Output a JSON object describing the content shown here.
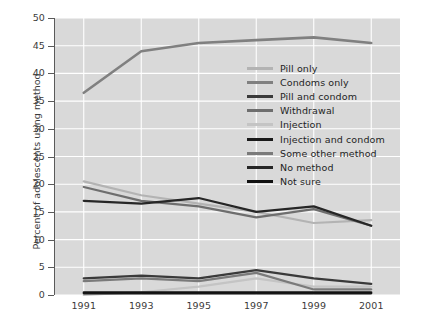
{
  "chart_data": {
    "type": "line",
    "title": "",
    "xlabel": "",
    "ylabel": "Percent of adolescents using method",
    "categories": [
      "1991",
      "1993",
      "1995",
      "1997",
      "1999",
      "2001"
    ],
    "x": [
      1991,
      1993,
      1995,
      1997,
      1999,
      2001
    ],
    "ylim": [
      0,
      50
    ],
    "yticks": [
      0,
      5,
      10,
      15,
      20,
      25,
      30,
      35,
      40,
      45,
      50
    ],
    "grid": true,
    "legend_position": "center-right",
    "plot_background": "#d9d9d9",
    "series": [
      {
        "name": "Pill only",
        "color": "#b3b3b3",
        "width": 2.2,
        "values": [
          20.5,
          18.0,
          16.5,
          15.0,
          13.0,
          13.5
        ]
      },
      {
        "name": "Condoms only",
        "color": "#808080",
        "width": 2.6,
        "values": [
          36.5,
          44.0,
          45.5,
          46.0,
          46.5,
          45.5
        ]
      },
      {
        "name": "Pill and condom",
        "color": "#3a3a3a",
        "width": 2.2,
        "values": [
          3.0,
          3.5,
          3.0,
          4.5,
          3.0,
          2.0
        ]
      },
      {
        "name": "Withdrawal",
        "color": "#6e6e6e",
        "width": 2.2,
        "values": [
          19.5,
          17.0,
          16.0,
          14.0,
          15.5,
          12.5
        ]
      },
      {
        "name": "Injection",
        "color": "#c4c4c4",
        "width": 2.2,
        "values": [
          0.0,
          0.5,
          1.5,
          3.0,
          1.5,
          1.5
        ]
      },
      {
        "name": "Injection and condom",
        "color": "#1a1a1a",
        "width": 2.2,
        "values": [
          0.3,
          0.3,
          0.3,
          0.3,
          0.3,
          0.3
        ]
      },
      {
        "name": "Some other method",
        "color": "#7a7a7a",
        "width": 2.2,
        "values": [
          2.5,
          3.0,
          2.5,
          4.0,
          1.0,
          1.0
        ]
      },
      {
        "name": "No method",
        "color": "#262626",
        "width": 2.2,
        "values": [
          17.0,
          16.5,
          17.5,
          15.0,
          16.0,
          12.5
        ]
      },
      {
        "name": "Not sure",
        "color": "#111111",
        "width": 2.2,
        "values": [
          0.5,
          0.5,
          0.5,
          0.5,
          0.5,
          0.5
        ]
      }
    ]
  },
  "axis": {
    "y_title": "Percent of adolescents using method",
    "y_tick_labels": [
      "0",
      "5",
      "10",
      "15",
      "20",
      "25",
      "30",
      "35",
      "40",
      "45",
      "50"
    ],
    "x_tick_labels": [
      "1991",
      "1993",
      "1995",
      "1997",
      "1999",
      "2001"
    ]
  },
  "legend": {
    "items": [
      {
        "label": "Pill only",
        "color": "#b3b3b3"
      },
      {
        "label": "Condoms only",
        "color": "#808080"
      },
      {
        "label": "Pill and condom",
        "color": "#3a3a3a"
      },
      {
        "label": "Withdrawal",
        "color": "#6e6e6e"
      },
      {
        "label": "Injection",
        "color": "#c4c4c4"
      },
      {
        "label": "Injection and condom",
        "color": "#1a1a1a"
      },
      {
        "label": "Some other method",
        "color": "#7a7a7a"
      },
      {
        "label": "No method",
        "color": "#262626"
      },
      {
        "label": "Not sure",
        "color": "#111111"
      }
    ]
  }
}
